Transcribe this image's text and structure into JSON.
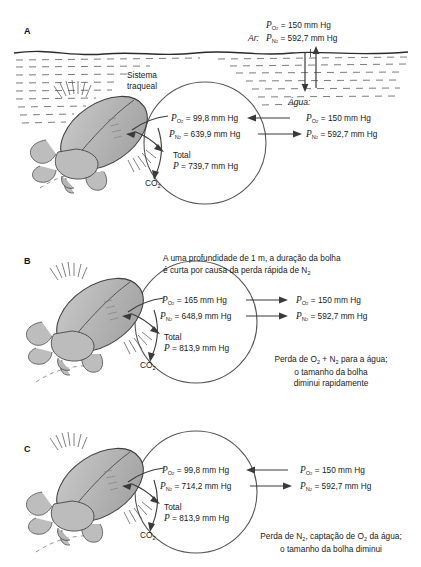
{
  "figure": {
    "units": "mm Hg",
    "colors": {
      "ink": "#1a1a1a",
      "beetle_body": "#b8b8b8",
      "beetle_dark": "#8a8a8a",
      "water_line": "#333333",
      "bubble_outline": "#555555"
    }
  },
  "panels": [
    {
      "letter": "A",
      "beetle_label": "Sistema\ntraqueal",
      "beetle_label_line1": "Sistema",
      "beetle_label_line2": "traqueal",
      "air_header": "Ar:",
      "air_po2": "= 150 mm Hg",
      "air_pn2": "= 592,7 mm Hg",
      "water_header": "Água:",
      "water_po2": "= 150 mm Hg",
      "water_pn2": "= 592,7 mm Hg",
      "bubble_po2": "= 99,8 mm Hg",
      "bubble_pn2": "= 639,9 mm Hg",
      "total_label": "Total",
      "total_value": "= 739,7 mm Hg",
      "co2_label": "CO",
      "co2_sub": "2",
      "o2_arrow_direction": "left",
      "n2_arrow_direction": "right",
      "caption": ""
    },
    {
      "letter": "B",
      "caption_top_line1": "A uma profundidade de 1 m, a duração da bolha",
      "caption_top_line2": "é curta por causa da perda rápida  de N",
      "caption_top_sub": "2",
      "bubble_po2": "= 165  mm Hg",
      "bubble_pn2": "= 648,9 mm Hg",
      "water_po2": "= 150 mm Hg",
      "water_pn2": "= 592,7 mm Hg",
      "total_label": "Total",
      "total_value": "= 813,9 mm Hg",
      "co2_label": "CO",
      "co2_sub": "2",
      "o2_arrow_direction": "right",
      "n2_arrow_direction": "right",
      "caption_bottom_line1_a": "Perda de O",
      "caption_bottom_line1_b": " + N",
      "caption_bottom_line1_c": " para a água;",
      "caption_bottom_line2": "o tamanho da bolha",
      "caption_bottom_line3": "diminui rapidamente"
    },
    {
      "letter": "C",
      "bubble_po2": "= 99,8 mm Hg",
      "bubble_pn2": "= 714,2 mm Hg",
      "water_po2": "= 150 mm Hg",
      "water_pn2": "= 592,7 mm Hg",
      "total_label": "Total",
      "total_value": "= 813,9 mm Hg",
      "co2_label": "CO",
      "co2_sub": "2",
      "o2_arrow_direction": "left",
      "n2_arrow_direction": "right",
      "caption_bottom_line1_a": "Perda de N",
      "caption_bottom_line1_b": ", captação de O",
      "caption_bottom_line1_c": " da água;",
      "caption_bottom_line2": "o tamanho da bolha diminui"
    }
  ],
  "symbols": {
    "p": "P",
    "o2_sub": "O",
    "o2_sub_num": "2",
    "n2_sub": "N",
    "n2_sub_num": "2"
  }
}
